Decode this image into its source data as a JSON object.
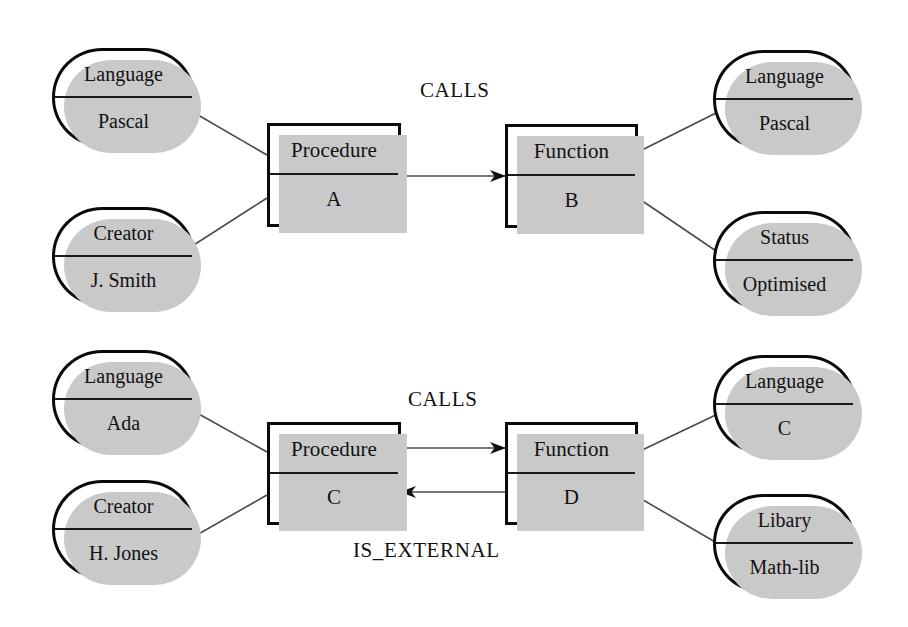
{
  "diagram": {
    "background_color": "#ffffff",
    "line_color": "#4a4a4a",
    "border_color": "#0a0a0a",
    "shadow_color": "#c9c9c9"
  },
  "entities": [
    {
      "id": "procedure-a",
      "type": "Procedure",
      "name": "A",
      "x": 267,
      "y": 123,
      "w": 134,
      "h": 104
    },
    {
      "id": "function-b",
      "type": "Function",
      "name": "B",
      "x": 505,
      "y": 124,
      "w": 133,
      "h": 104
    },
    {
      "id": "procedure-c",
      "type": "Procedure",
      "name": "C",
      "x": 267,
      "y": 422,
      "w": 134,
      "h": 103
    },
    {
      "id": "function-d",
      "type": "Function",
      "name": "D",
      "x": 505,
      "y": 422,
      "w": 133,
      "h": 103
    }
  ],
  "attributes": [
    {
      "id": "attr-lang-pascal-left",
      "key": "Language",
      "value": "Pascal",
      "x": 52,
      "y": 48,
      "w": 143,
      "h": 99
    },
    {
      "id": "attr-creator-jsmith",
      "key": "Creator",
      "value": "J. Smith",
      "x": 52,
      "y": 207,
      "w": 143,
      "h": 99
    },
    {
      "id": "attr-lang-pascal-right",
      "key": "Language",
      "value": "Pascal",
      "x": 713,
      "y": 50,
      "w": 143,
      "h": 99
    },
    {
      "id": "attr-status-optimised",
      "key": "Status",
      "value": "Optimised",
      "x": 713,
      "y": 211,
      "w": 143,
      "h": 99
    },
    {
      "id": "attr-lang-ada",
      "key": "Language",
      "value": "Ada",
      "x": 52,
      "y": 350,
      "w": 143,
      "h": 99
    },
    {
      "id": "attr-creator-hjones",
      "key": "Creator",
      "value": "H. Jones",
      "x": 52,
      "y": 480,
      "w": 143,
      "h": 99
    },
    {
      "id": "attr-lang-c",
      "key": "Language",
      "value": "C",
      "x": 713,
      "y": 355,
      "w": 143,
      "h": 99
    },
    {
      "id": "attr-libary-mathlib",
      "key": "Libary",
      "value": "Math-lib",
      "x": 713,
      "y": 494,
      "w": 143,
      "h": 99
    }
  ],
  "relationships": [
    {
      "id": "rel-calls-top",
      "label": "CALLS",
      "from": "procedure-a",
      "to": "function-b",
      "direction": "right",
      "label_x": 420,
      "label_y": 78
    },
    {
      "id": "rel-calls-bottom",
      "label": "CALLS",
      "from": "procedure-c",
      "to": "function-d",
      "direction": "right",
      "label_x": 408,
      "label_y": 387
    },
    {
      "id": "rel-is-external",
      "label": "IS_EXTERNAL",
      "from": "function-d",
      "to": "procedure-c",
      "direction": "left",
      "label_x": 353,
      "label_y": 538
    }
  ]
}
